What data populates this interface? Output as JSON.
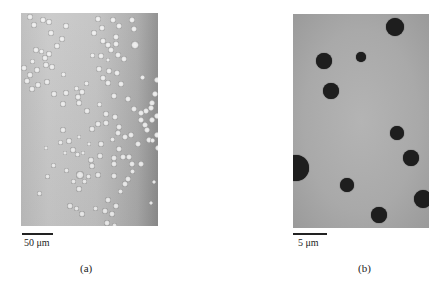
{
  "figure": {
    "panels": [
      {
        "id": "a",
        "caption": "(a)",
        "scale_bar_label": "50 μm",
        "description": "bright-field micrograph, many light droplets with dark rims",
        "droplets": [
          [
            9,
            4,
            3
          ],
          [
            22,
            7,
            3
          ],
          [
            28,
            9,
            3
          ],
          [
            13,
            12,
            3
          ],
          [
            77,
            6,
            3
          ],
          [
            92,
            7,
            3
          ],
          [
            81,
            15,
            3
          ],
          [
            73,
            20,
            3
          ],
          [
            98,
            13,
            3
          ],
          [
            111,
            7,
            3
          ],
          [
            113,
            16,
            3
          ],
          [
            95,
            24,
            3
          ],
          [
            45,
            13,
            3
          ],
          [
            30,
            20,
            3
          ],
          [
            41,
            26,
            3
          ],
          [
            36,
            33,
            3
          ],
          [
            20,
            38,
            2.5
          ],
          [
            28,
            41,
            3
          ],
          [
            15,
            37,
            3
          ],
          [
            11,
            48,
            2.5
          ],
          [
            25,
            52,
            3
          ],
          [
            24,
            45,
            3
          ],
          [
            82,
            28,
            3
          ],
          [
            87,
            32,
            3
          ],
          [
            95,
            31,
            3
          ],
          [
            90,
            37,
            3
          ],
          [
            97,
            42,
            3
          ],
          [
            80,
            43,
            3
          ],
          [
            114,
            32,
            4
          ],
          [
            103,
            46,
            3
          ],
          [
            71,
            42,
            2.5
          ],
          [
            87,
            47,
            2
          ],
          [
            3,
            55,
            3
          ],
          [
            9,
            62,
            3
          ],
          [
            16,
            57,
            3
          ],
          [
            31,
            54,
            3
          ],
          [
            42,
            61,
            2.5
          ],
          [
            6,
            68,
            3
          ],
          [
            17,
            72,
            3
          ],
          [
            26,
            69,
            3
          ],
          [
            33,
            81,
            3
          ],
          [
            11,
            76,
            3
          ],
          [
            78,
            56,
            3
          ],
          [
            88,
            58,
            3
          ],
          [
            96,
            60,
            3
          ],
          [
            82,
            65,
            3
          ],
          [
            87,
            70,
            3
          ],
          [
            65,
            70,
            2.5
          ],
          [
            100,
            71,
            3
          ],
          [
            93,
            83,
            3
          ],
          [
            78,
            91,
            2.5
          ],
          [
            121,
            64,
            2.5
          ],
          [
            136,
            67,
            3
          ],
          [
            134,
            81,
            3
          ],
          [
            131,
            90,
            3
          ],
          [
            130,
            95,
            3
          ],
          [
            125,
            98,
            3
          ],
          [
            120,
            100,
            3
          ],
          [
            107,
            86,
            3
          ],
          [
            113,
            96,
            3
          ],
          [
            124,
            112,
            3
          ],
          [
            120,
            107,
            3
          ],
          [
            131,
            107,
            3
          ],
          [
            136,
            103,
            3
          ],
          [
            45,
            80,
            3
          ],
          [
            55,
            75,
            2.5
          ],
          [
            61,
            79,
            3
          ],
          [
            57,
            84,
            3
          ],
          [
            42,
            91,
            3
          ],
          [
            58,
            90,
            3
          ],
          [
            66,
            98,
            3
          ],
          [
            85,
            101,
            3
          ],
          [
            94,
            104,
            3
          ],
          [
            85,
            110,
            3
          ],
          [
            42,
            117,
            3
          ],
          [
            71,
            116,
            3
          ],
          [
            77,
            111,
            3
          ],
          [
            98,
            114,
            3
          ],
          [
            104,
            124,
            3
          ],
          [
            110,
            122,
            3
          ],
          [
            128,
            127,
            3
          ],
          [
            136,
            122,
            3
          ],
          [
            126,
            117,
            3
          ],
          [
            137,
            135,
            3
          ],
          [
            131,
            127,
            2.5
          ],
          [
            48,
            128,
            3
          ],
          [
            58,
            124,
            2
          ],
          [
            52,
            137,
            3
          ],
          [
            56,
            141,
            2.5
          ],
          [
            80,
            131,
            3
          ],
          [
            98,
            136,
            3
          ],
          [
            102,
            144,
            3
          ],
          [
            93,
            145,
            3
          ],
          [
            93,
            151,
            3
          ],
          [
            108,
            144,
            3
          ],
          [
            111,
            151,
            3
          ],
          [
            97,
            120,
            3
          ],
          [
            91,
            126,
            2.5
          ],
          [
            25,
            135,
            2
          ],
          [
            44,
            140,
            2
          ],
          [
            68,
            131,
            2
          ],
          [
            59,
            162,
            4
          ],
          [
            70,
            147,
            3
          ],
          [
            79,
            143,
            3
          ],
          [
            71,
            153,
            3
          ],
          [
            32,
            152,
            2.5
          ],
          [
            45,
            157,
            2.5
          ],
          [
            62,
            140,
            2
          ],
          [
            39,
            129,
            2.5
          ],
          [
            26,
            163,
            2.5
          ],
          [
            67,
            163,
            2.5
          ],
          [
            77,
            162,
            3
          ],
          [
            93,
            163,
            3
          ],
          [
            107,
            166,
            3
          ],
          [
            111,
            158,
            2.5
          ],
          [
            120,
            151,
            3
          ],
          [
            117,
            131,
            3
          ],
          [
            104,
            171,
            3
          ],
          [
            99,
            178,
            2.5
          ],
          [
            87,
            187,
            3
          ],
          [
            84,
            198,
            3
          ],
          [
            74,
            195,
            2.5
          ],
          [
            49,
            193,
            3
          ],
          [
            55,
            195,
            2.5
          ],
          [
            61,
            201,
            3
          ],
          [
            91,
            201,
            3
          ],
          [
            86,
            210,
            3
          ],
          [
            93,
            212,
            2.5
          ],
          [
            18,
            180,
            2.5
          ],
          [
            52,
            168,
            2.5
          ],
          [
            63,
            168,
            2.5
          ],
          [
            58,
            176,
            3
          ],
          [
            133,
            169,
            2
          ],
          [
            130,
            190,
            2
          ],
          [
            95,
            193,
            3
          ]
        ]
      },
      {
        "id": "b",
        "caption": "(b)",
        "scale_bar_label": "5 μm",
        "description": "micrograph, few dark particles on grey background",
        "droplets": [
          [
            102,
            13,
            9
          ],
          [
            31,
            47,
            8
          ],
          [
            68,
            43,
            5
          ],
          [
            38,
            77,
            8
          ],
          [
            104,
            119,
            7
          ],
          [
            118,
            144,
            8
          ],
          [
            3,
            154,
            13
          ],
          [
            54,
            171,
            7
          ],
          [
            86,
            201,
            8
          ],
          [
            130,
            185,
            9
          ]
        ]
      }
    ]
  }
}
